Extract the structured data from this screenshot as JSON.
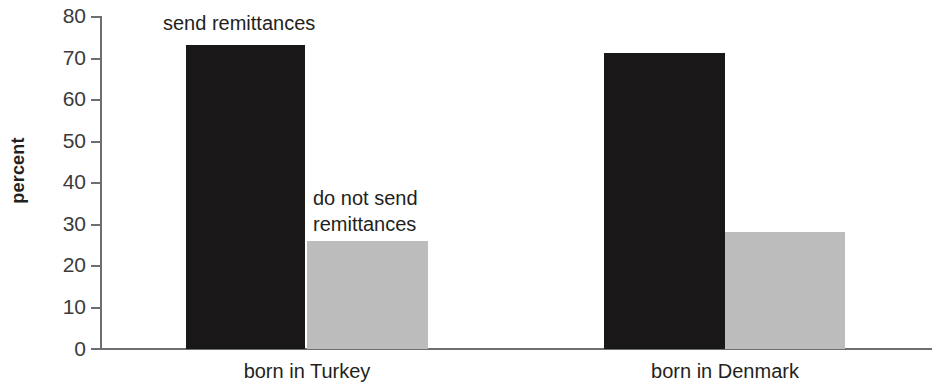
{
  "chart_data": {
    "type": "bar",
    "title": "",
    "xlabel": "",
    "ylabel": "percent",
    "ylim": [
      0,
      80
    ],
    "ytick_step": 10,
    "yticks": [
      "80",
      "70",
      "60",
      "50",
      "40",
      "30",
      "20",
      "10",
      "0"
    ],
    "grid": false,
    "legend_position": "inline-annotations",
    "categories": [
      "born in Turkey",
      "born in Denmark"
    ],
    "series": [
      {
        "name": "send remittances",
        "color": "#1a1718",
        "values": [
          73,
          71
        ]
      },
      {
        "name": "do not send remittances",
        "color": "#bcbcbc",
        "values": [
          26,
          28
        ]
      }
    ],
    "annotations": [
      {
        "text": "send remittances",
        "target_series": "send remittances"
      },
      {
        "text": "do not send\nremittances",
        "target_series": "do not send remittances"
      }
    ]
  },
  "axis": {
    "y_title": "percent"
  }
}
